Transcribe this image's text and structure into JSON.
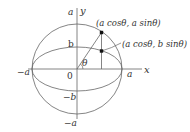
{
  "diagram": {
    "axes": {
      "x_label": "x",
      "y_label": "y",
      "origin_label": "0"
    },
    "labels": {
      "y_top": "a",
      "y_b": "b",
      "y_neg_b": "−b",
      "y_bottom": "−a",
      "x_left": "−a",
      "x_right": "a",
      "angle": "θ"
    },
    "points": [
      {
        "name": "circle-point",
        "label": "(a cosθ, a sinθ)"
      },
      {
        "name": "ellipse-point",
        "label": "(a cosθ, b sinθ)"
      }
    ],
    "shapes": {
      "auxiliary_circle": "radius a",
      "ellipse": "semi-axes a, b"
    },
    "colors": {
      "stroke": "#555555",
      "text": "#333333",
      "point": "#111111"
    }
  }
}
